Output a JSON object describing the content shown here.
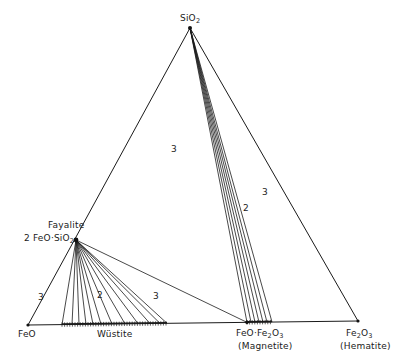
{
  "diagram": {
    "vertices": {
      "SiO2": {
        "label": "SiO",
        "sub": "2",
        "x": 190,
        "y": 28
      },
      "FeO": {
        "label": "FeO",
        "x": 28,
        "y": 325
      },
      "Fe2O3": {
        "label_pre": "Fe",
        "sub1": "2",
        "label_mid": "O",
        "sub2": "3",
        "name": "(Hematite)",
        "x": 358,
        "y": 321
      }
    },
    "phases": {
      "fayalite": {
        "name": "Fayalite",
        "formula_pre": "2 FeO·SiO",
        "sub": "2",
        "x": 76,
        "y": 240
      },
      "wustite": {
        "name": "Wüstite",
        "x_start": 62,
        "x_end": 167,
        "y": 324
      },
      "magnetite": {
        "formula_pre": "FeO·Fe",
        "sub1": "2",
        "formula_mid": "O",
        "sub2": "3",
        "name": "(Magnetite)",
        "x_start": 247,
        "x_end": 272,
        "y": 322
      }
    },
    "region_labels": [
      {
        "text": "3",
        "x": 171,
        "y": 144
      },
      {
        "text": "3",
        "x": 262,
        "y": 187
      },
      {
        "text": "2",
        "x": 243,
        "y": 203
      },
      {
        "text": "3",
        "x": 38,
        "y": 292
      },
      {
        "text": "2",
        "x": 97,
        "y": 290
      },
      {
        "text": "3",
        "x": 153,
        "y": 291
      }
    ],
    "tie_lines_fayalite_wustite_x": [
      62,
      72,
      79,
      86,
      93,
      101,
      112,
      125,
      138,
      150,
      160,
      167
    ],
    "tie_lines_silica_magnetite_x": [
      247,
      251,
      255,
      259,
      263,
      267,
      272
    ],
    "colors": {
      "line": "#1a1a1a",
      "background": "#ffffff"
    }
  }
}
